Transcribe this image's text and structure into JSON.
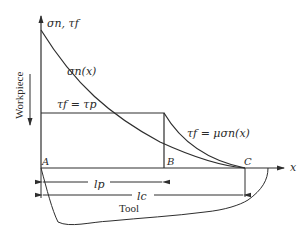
{
  "diagram": {
    "type": "stress distribution on tool rake face",
    "axes": {
      "vertical_label": "σn, τf",
      "horizontal_label": "x"
    },
    "curves": {
      "normal_stress": "σn(x)",
      "plateau": "τf = τp",
      "friction": "τf = μσn(x)"
    },
    "points": {
      "A": "A",
      "B": "B",
      "C": "C"
    },
    "dimensions": {
      "plastic_length": "lp",
      "contact_length": "lc"
    },
    "regions": {
      "workpiece": "Workpiece",
      "tool": "Tool"
    },
    "colors": {
      "line": "#2e2e2e",
      "background": "#ffffff"
    }
  }
}
